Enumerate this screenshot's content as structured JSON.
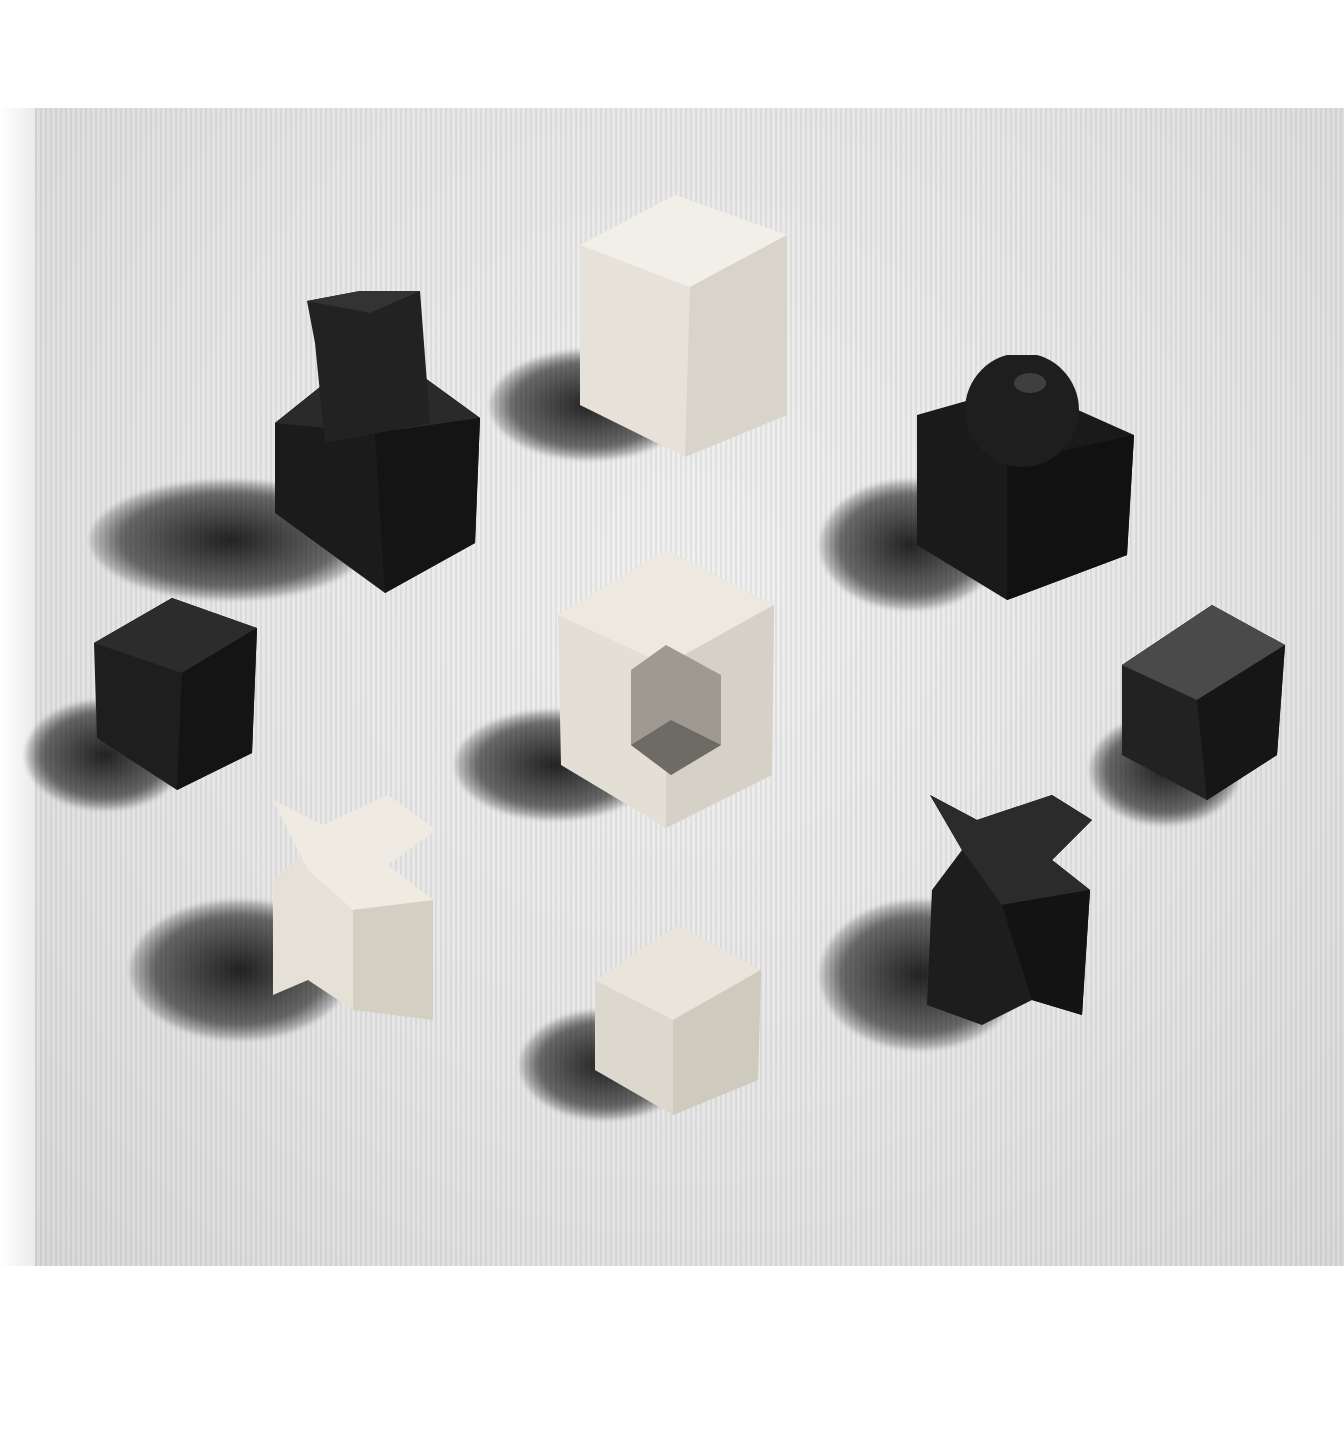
{
  "photo": {
    "subject": "Bauhaus-style geometric chess pieces",
    "style": "black-and-white photograph",
    "colors": {
      "dark_wood": "#1e1e1e",
      "light_wood": "#e2ddd2",
      "background": "#e8e8e8",
      "shadow": "#111111"
    },
    "pieces": [
      {
        "id": "dark-knight",
        "shape": "cube with tilted block on top",
        "tone": "dark"
      },
      {
        "id": "light-cube-top",
        "shape": "cube",
        "tone": "light"
      },
      {
        "id": "dark-queen",
        "shape": "cube with sphere on top",
        "tone": "dark"
      },
      {
        "id": "dark-cube-left",
        "shape": "small cube",
        "tone": "dark"
      },
      {
        "id": "light-king",
        "shape": "cube with notched corner",
        "tone": "light"
      },
      {
        "id": "dark-cube-right",
        "shape": "small cube",
        "tone": "dark"
      },
      {
        "id": "light-bishop",
        "shape": "x-shaped cross prism",
        "tone": "light"
      },
      {
        "id": "light-pawn",
        "shape": "small cube",
        "tone": "light"
      },
      {
        "id": "dark-bishop",
        "shape": "x-shaped cross prism",
        "tone": "dark"
      }
    ]
  }
}
